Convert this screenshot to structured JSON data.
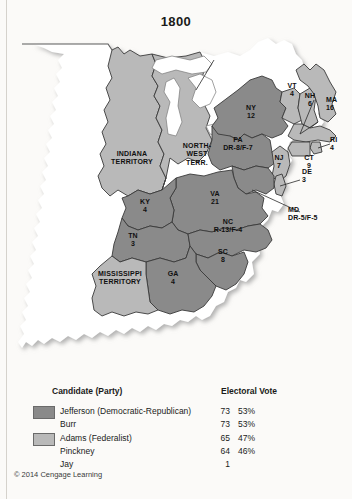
{
  "title": "1800",
  "copyright": "© 2014 Cengage Learning",
  "colors": {
    "democratic_republican": "#8a8a8a",
    "federalist": "#b9b9b9",
    "unorganized": "#ffffff",
    "background": "#fbfaf8",
    "border": "#3a3a3a"
  },
  "legend": {
    "header_candidate": "Candidate (Party)",
    "header_electoral_vote": "Electoral Vote",
    "groups": [
      {
        "swatch": "democratic_republican",
        "rows": [
          {
            "name": "Jefferson (Democratic-Republican)",
            "votes": "73",
            "pct": "53%"
          },
          {
            "name": "Burr",
            "votes": "73",
            "pct": "53%"
          }
        ]
      },
      {
        "swatch": "federalist",
        "rows": [
          {
            "name": "Adams (Federalist)",
            "votes": "65",
            "pct": "47%"
          },
          {
            "name": "Pinckney",
            "votes": "64",
            "pct": "46%"
          },
          {
            "name": "Jay",
            "votes": "1",
            "pct": ""
          }
        ]
      }
    ]
  },
  "map": {
    "labels": [
      {
        "id": "indiana-territory",
        "name": "INDIANA TERRITORY",
        "line1": "INDIANA",
        "line2": "TERRITORY",
        "value": "",
        "party": "federalist"
      },
      {
        "id": "northwest-territory",
        "name": "NORTH-WEST TERR.",
        "line1": "NORTH-",
        "line2": "WEST",
        "line3": "TERR.",
        "value": "",
        "party": "federalist"
      },
      {
        "id": "mississippi-territory",
        "name": "MISSISSIPPI TERRITORY",
        "line1": "MISSISSIPPI",
        "line2": "TERRITORY",
        "value": "",
        "party": "federalist"
      },
      {
        "id": "kentucky",
        "name": "KY",
        "line1": "KY",
        "line2": "4",
        "value": "4",
        "party": "democratic_republican"
      },
      {
        "id": "tennessee",
        "name": "TN",
        "line1": "TN",
        "line2": "3",
        "value": "3",
        "party": "democratic_republican"
      },
      {
        "id": "georgia",
        "name": "GA",
        "line1": "GA",
        "line2": "4",
        "value": "4",
        "party": "democratic_republican"
      },
      {
        "id": "south-carolina",
        "name": "SC",
        "line1": "SC",
        "line2": "8",
        "value": "8",
        "party": "democratic_republican"
      },
      {
        "id": "north-carolina",
        "name": "NC",
        "line1": "NC",
        "line2": "R-13/F-4",
        "value": "R-13/F-4",
        "party": "split"
      },
      {
        "id": "virginia",
        "name": "VA",
        "line1": "VA",
        "line2": "21",
        "value": "21",
        "party": "democratic_republican"
      },
      {
        "id": "pennsylvania",
        "name": "PA",
        "line1": "PA",
        "line2": "DR-8/F-7",
        "value": "DR-8/F-7",
        "party": "split"
      },
      {
        "id": "maryland",
        "name": "MD",
        "line1": "MD",
        "line2": "DR-5/F-5",
        "value": "DR-5/F-5",
        "party": "split"
      },
      {
        "id": "delaware",
        "name": "DE",
        "line1": "DE",
        "line2": "3",
        "value": "3",
        "party": "federalist"
      },
      {
        "id": "new-jersey",
        "name": "NJ",
        "line1": "NJ",
        "line2": "7",
        "value": "7",
        "party": "federalist"
      },
      {
        "id": "new-york",
        "name": "NY",
        "line1": "NY",
        "line2": "12",
        "value": "12",
        "party": "democratic_republican"
      },
      {
        "id": "vermont",
        "name": "VT",
        "line1": "VT",
        "line2": "4",
        "value": "4",
        "party": "federalist"
      },
      {
        "id": "new-hampshire",
        "name": "NH",
        "line1": "NH",
        "line2": "6",
        "value": "6",
        "party": "federalist"
      },
      {
        "id": "massachusetts",
        "name": "MA",
        "line1": "MA",
        "line2": "16",
        "value": "16",
        "party": "federalist"
      },
      {
        "id": "rhode-island",
        "name": "RI",
        "line1": "RI",
        "line2": "4",
        "value": "4",
        "party": "federalist"
      },
      {
        "id": "connecticut",
        "name": "CT",
        "line1": "CT",
        "line2": "9",
        "value": "9",
        "party": "federalist"
      }
    ]
  }
}
